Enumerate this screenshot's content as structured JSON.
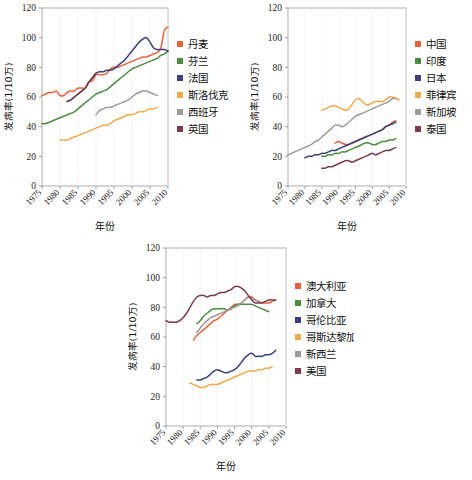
{
  "figure": {
    "background": "#ffffff",
    "panel_count": 3
  },
  "axes_common": {
    "xlabel": "年份",
    "ylabel": "发病率(1/10万)",
    "ylim": [
      0,
      120
    ],
    "yticks": [
      0,
      20,
      40,
      60,
      80,
      100,
      120
    ],
    "xlim": [
      1975,
      2010
    ],
    "xticks": [
      1975,
      1980,
      1985,
      1990,
      1995,
      2000,
      2005,
      2010
    ],
    "xtick_labels": [
      "1975",
      "1980",
      "1985",
      "1990",
      "1995",
      "2000",
      "2005",
      "2010"
    ],
    "ytick_labels": [
      "0",
      "20",
      "40",
      "60",
      "80",
      "100",
      "120"
    ],
    "grid": "vertical-faint",
    "legend_position": "right"
  },
  "palette": {
    "red_orange": "#E8613C",
    "green": "#4C8C3F",
    "navy": "#3C3F78",
    "amber": "#F0A94C",
    "gray": "#9B9B9B",
    "maroon": "#7A3B52"
  },
  "chart_data": [
    {
      "id": "europe",
      "type": "line",
      "title": "",
      "xlabel": "年份",
      "ylabel": "发病率(1/10万)",
      "xlim": [
        1975,
        2010
      ],
      "ylim": [
        0,
        120
      ],
      "grid": "vertical-faint",
      "legend_position": "right",
      "series": [
        {
          "name": "丹麦",
          "color": "#E8613C",
          "x": [
            1975,
            1976,
            1977,
            1978,
            1979,
            1980,
            1981,
            1982,
            1983,
            1984,
            1985,
            1986,
            1987,
            1988,
            1989,
            1990,
            1991,
            1992,
            1993,
            1994,
            1995,
            1996,
            1997,
            1998,
            1999,
            2000,
            2001,
            2002,
            2003,
            2004,
            2005,
            2006,
            2007,
            2008,
            2009,
            2010
          ],
          "y": [
            61,
            62,
            63,
            63,
            64,
            61,
            61,
            63,
            64,
            64,
            66,
            66,
            66,
            70,
            71,
            75,
            75,
            75,
            76,
            79,
            80,
            80,
            81,
            82,
            83,
            84,
            85,
            86,
            87,
            87,
            88,
            89,
            90,
            93,
            105,
            107
          ]
        },
        {
          "name": "芬兰",
          "color": "#4C8C3F",
          "x": [
            1975,
            1976,
            1977,
            1978,
            1979,
            1980,
            1981,
            1982,
            1983,
            1984,
            1985,
            1986,
            1987,
            1988,
            1989,
            1990,
            1991,
            1992,
            1993,
            1994,
            1995,
            1996,
            1997,
            1998,
            1999,
            2000,
            2001,
            2002,
            2003,
            2004,
            2005,
            2006,
            2007,
            2008,
            2009,
            2010
          ],
          "y": [
            42,
            42,
            43,
            44,
            45,
            46,
            47,
            48,
            49,
            50,
            52,
            54,
            56,
            58,
            60,
            62,
            63,
            64,
            65,
            67,
            69,
            71,
            73,
            75,
            77,
            79,
            80,
            81,
            82,
            83,
            84,
            85,
            86,
            88,
            89,
            91
          ]
        },
        {
          "name": "法国",
          "color": "#3C3F78",
          "x": [
            1982,
            1983,
            1984,
            1985,
            1986,
            1987,
            1988,
            1989,
            1990,
            1991,
            1992,
            1993,
            1994,
            1995,
            1996,
            1997,
            1998,
            1999,
            2000,
            2001,
            2002,
            2003,
            2004,
            2005,
            2006,
            2007,
            2008,
            2009,
            2010
          ],
          "y": [
            57,
            58,
            60,
            62,
            64,
            66,
            70,
            73,
            76,
            77,
            77,
            78,
            78,
            79,
            81,
            83,
            85,
            88,
            91,
            94,
            97,
            99,
            100,
            97,
            93,
            92,
            92,
            92,
            91
          ]
        },
        {
          "name": "斯洛伐克",
          "color": "#F0A94C",
          "x": [
            1980,
            1981,
            1982,
            1983,
            1984,
            1985,
            1986,
            1987,
            1988,
            1989,
            1990,
            1991,
            1992,
            1993,
            1994,
            1995,
            1996,
            1997,
            1998,
            1999,
            2000,
            2001,
            2002,
            2003,
            2004,
            2005,
            2006,
            2007
          ],
          "y": [
            31,
            31,
            31,
            32,
            33,
            34,
            35,
            36,
            37,
            38,
            39,
            40,
            41,
            41,
            42,
            44,
            45,
            46,
            47,
            48,
            48,
            49,
            50,
            50,
            51,
            52,
            52,
            53
          ]
        },
        {
          "name": "西班牙",
          "color": "#9B9B9B",
          "x": [
            1990,
            1991,
            1992,
            1993,
            1994,
            1995,
            1996,
            1997,
            1998,
            1999,
            2000,
            2001,
            2002,
            2003,
            2004,
            2005,
            2006,
            2007
          ],
          "y": [
            48,
            51,
            52,
            53,
            53,
            54,
            55,
            56,
            57,
            58,
            60,
            62,
            63,
            64,
            64,
            63,
            62,
            61
          ]
        },
        {
          "name": "英国",
          "color": "#7A3B52",
          "x": [
            1982,
            1983,
            1984,
            1985,
            1986,
            1987,
            1988,
            1989,
            1990
          ],
          "y": [
            57,
            58,
            60,
            62,
            64,
            66,
            70,
            73,
            76
          ]
        }
      ]
    },
    {
      "id": "asia",
      "type": "line",
      "title": "",
      "xlabel": "年份",
      "ylabel": "发病率(1/10万)",
      "xlim": [
        1975,
        2010
      ],
      "ylim": [
        0,
        120
      ],
      "grid": "vertical-faint",
      "legend_position": "right",
      "series": [
        {
          "name": "中国",
          "color": "#E8613C",
          "x": [
            1989,
            1990,
            1991,
            1992,
            1993,
            1994,
            1995,
            1996,
            1997,
            1998,
            1999,
            2000,
            2001,
            2002,
            2003,
            2004,
            2005,
            2006,
            2007
          ],
          "y": [
            29,
            30,
            29,
            28,
            28,
            29,
            30,
            31,
            32,
            33,
            34,
            35,
            36,
            37,
            38,
            40,
            41,
            43,
            44
          ]
        },
        {
          "name": "印度",
          "color": "#4C8C3F",
          "x": [
            1985,
            1986,
            1987,
            1988,
            1989,
            1990,
            1991,
            1992,
            1993,
            1994,
            1995,
            1996,
            1997,
            1998,
            1999,
            2000,
            2001,
            2002,
            2003,
            2004,
            2005,
            2006,
            2007
          ],
          "y": [
            20,
            20,
            21,
            21,
            22,
            22,
            23,
            23,
            24,
            25,
            26,
            27,
            28,
            29,
            29,
            28,
            28,
            29,
            30,
            30,
            31,
            31,
            32
          ]
        },
        {
          "name": "日本",
          "color": "#3C3F78",
          "x": [
            1980,
            1981,
            1982,
            1983,
            1984,
            1985,
            1986,
            1987,
            1988,
            1989,
            1990,
            1991,
            1992,
            1993,
            1994,
            1995,
            1996,
            1997,
            1998,
            1999,
            2000,
            2001,
            2002,
            2003,
            2004,
            2005,
            2006,
            2007
          ],
          "y": [
            19,
            20,
            20,
            21,
            21,
            22,
            22,
            23,
            24,
            24,
            25,
            26,
            27,
            28,
            29,
            30,
            31,
            32,
            33,
            34,
            35,
            36,
            37,
            38,
            40,
            41,
            42,
            43
          ]
        },
        {
          "name": "菲律宾",
          "color": "#F0A94C",
          "x": [
            1985,
            1986,
            1987,
            1988,
            1989,
            1990,
            1991,
            1992,
            1993,
            1994,
            1995,
            1996,
            1997,
            1998,
            1999,
            2000,
            2001,
            2002,
            2003,
            2004,
            2005,
            2006,
            2007,
            2008
          ],
          "y": [
            51,
            52,
            53,
            54,
            54,
            53,
            52,
            51,
            52,
            55,
            58,
            59,
            57,
            55,
            55,
            56,
            57,
            57,
            57,
            58,
            60,
            60,
            59,
            58
          ]
        },
        {
          "name": "新加坡",
          "color": "#9B9B9B",
          "x": [
            1975,
            1976,
            1977,
            1978,
            1979,
            1980,
            1981,
            1982,
            1983,
            1984,
            1985,
            1986,
            1987,
            1988,
            1989,
            1990,
            1991,
            1992,
            1993,
            1994,
            1995,
            1996,
            1997,
            1998,
            1999,
            2000,
            2001,
            2002,
            2003,
            2004,
            2005,
            2006,
            2007
          ],
          "y": [
            21,
            22,
            23,
            24,
            25,
            26,
            27,
            28,
            30,
            31,
            33,
            35,
            37,
            39,
            41,
            41,
            40,
            41,
            43,
            45,
            47,
            48,
            49,
            50,
            51,
            52,
            53,
            54,
            55,
            56,
            57,
            59,
            59
          ]
        },
        {
          "name": "泰国",
          "color": "#7A3B52",
          "x": [
            1985,
            1986,
            1987,
            1988,
            1989,
            1990,
            1991,
            1992,
            1993,
            1994,
            1995,
            1996,
            1997,
            1998,
            1999,
            2000,
            2001,
            2002,
            2003,
            2004,
            2005,
            2006,
            2007
          ],
          "y": [
            12,
            12,
            13,
            13,
            14,
            15,
            16,
            17,
            17,
            16,
            17,
            18,
            19,
            20,
            21,
            22,
            21,
            22,
            23,
            24,
            24,
            25,
            26
          ]
        }
      ]
    },
    {
      "id": "americas",
      "type": "line",
      "title": "",
      "xlabel": "年份",
      "ylabel": "发病率(1/10万)",
      "xlim": [
        1975,
        2010
      ],
      "ylim": [
        0,
        120
      ],
      "grid": "vertical-faint",
      "legend_position": "right",
      "series": [
        {
          "name": "澳大利亚",
          "color": "#E8613C",
          "x": [
            1983,
            1984,
            1985,
            1986,
            1987,
            1988,
            1989,
            1990,
            1991,
            1992,
            1993,
            1994,
            1995,
            1996,
            1997,
            1998,
            1999,
            2000,
            2001,
            2002,
            2003,
            2004,
            2005,
            2006,
            2007
          ],
          "y": [
            58,
            61,
            63,
            65,
            67,
            69,
            71,
            72,
            74,
            76,
            78,
            80,
            82,
            82,
            83,
            85,
            87,
            87,
            85,
            84,
            83,
            83,
            83,
            84,
            85
          ]
        },
        {
          "name": "加拿大",
          "color": "#4C8C3F",
          "x": [
            1984,
            1985,
            1986,
            1987,
            1988,
            1989,
            1990,
            1991,
            1992,
            1993,
            1994,
            1995,
            1996,
            1997,
            1998,
            1999,
            2000,
            2001,
            2002,
            2003,
            2004,
            2005
          ],
          "y": [
            69,
            71,
            74,
            76,
            78,
            79,
            79,
            79,
            79,
            78,
            79,
            81,
            82,
            82,
            82,
            82,
            82,
            81,
            80,
            79,
            78,
            77
          ]
        },
        {
          "name": "哥伦比亚",
          "color": "#3C3F78",
          "x": [
            1984,
            1985,
            1986,
            1987,
            1988,
            1989,
            1990,
            1991,
            1992,
            1993,
            1994,
            1995,
            1996,
            1997,
            1998,
            1999,
            2000,
            2001,
            2002,
            2003,
            2004,
            2005,
            2006,
            2007
          ],
          "y": [
            31,
            31,
            32,
            33,
            35,
            37,
            38,
            37,
            36,
            36,
            37,
            38,
            40,
            43,
            46,
            48,
            49,
            47,
            47,
            47,
            48,
            48,
            49,
            51
          ]
        },
        {
          "name": "哥斯达黎加",
          "color": "#F0A94C",
          "x": [
            1982,
            1983,
            1984,
            1985,
            1986,
            1987,
            1988,
            1989,
            1990,
            1991,
            1992,
            1993,
            1994,
            1995,
            1996,
            1997,
            1998,
            1999,
            2000,
            2001,
            2002,
            2003,
            2004,
            2005,
            2006
          ],
          "y": [
            29,
            28,
            27,
            26,
            26,
            27,
            28,
            28,
            28,
            29,
            30,
            31,
            32,
            33,
            34,
            35,
            36,
            37,
            37,
            37,
            38,
            38,
            39,
            39,
            40
          ]
        },
        {
          "name": "新西兰",
          "color": "#9B9B9B",
          "x": [
            1984,
            1985,
            1986,
            1987,
            1988,
            1989,
            1990,
            1991,
            1992,
            1993,
            1994,
            1995,
            1996,
            1997,
            1998,
            1999,
            2000,
            2001,
            2002,
            2003
          ],
          "y": [
            63,
            66,
            69,
            71,
            73,
            74,
            75,
            76,
            77,
            78,
            79,
            80,
            81,
            83,
            85,
            87,
            86,
            85,
            84,
            83
          ]
        },
        {
          "name": "美国",
          "color": "#7A3B52",
          "x": [
            1975,
            1976,
            1977,
            1978,
            1979,
            1980,
            1981,
            1982,
            1983,
            1984,
            1985,
            1986,
            1987,
            1988,
            1989,
            1990,
            1991,
            1992,
            1993,
            1994,
            1995,
            1996,
            1997,
            1998,
            1999,
            2000,
            2001,
            2002,
            2003,
            2004,
            2005,
            2006,
            2007
          ],
          "y": [
            71,
            70,
            70,
            70,
            71,
            73,
            76,
            80,
            84,
            87,
            88,
            88,
            87,
            88,
            88,
            89,
            90,
            90,
            91,
            92,
            94,
            94,
            93,
            91,
            88,
            85,
            83,
            83,
            83,
            84,
            85,
            85,
            85
          ]
        }
      ]
    }
  ]
}
